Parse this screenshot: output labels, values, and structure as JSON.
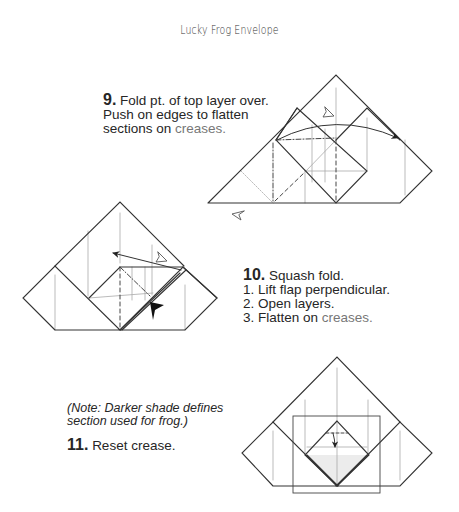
{
  "title": "Lucky Frog Envelope",
  "colors": {
    "text": "#262626",
    "crease_word": "#777777",
    "line": "#333333",
    "crease_line": "#aaaaaa",
    "shade": "#ededed"
  },
  "steps": [
    {
      "number": "9.",
      "lines": [
        "Fold pt. of top layer over.",
        "Push on edges to flatten",
        "sections on "
      ],
      "crease_word": "creases."
    },
    {
      "number": "10.",
      "title": "Squash fold.",
      "substeps": [
        "1. Lift flap perpendicular.",
        "2. Open layers.",
        "3. Flatten on "
      ],
      "crease_word": "creases."
    },
    {
      "note": [
        "(Note: Darker shade defines",
        "section used for frog.)"
      ],
      "number": "11.",
      "title": "Reset crease."
    }
  ],
  "icons": {
    "step9": [
      "valley-fold-arrow-icon",
      "turn-over-symbol-icon",
      "hollow-arrowhead-icon"
    ],
    "step10": [
      "fold-arrow-icon",
      "hollow-arrowhead-icon",
      "push-arrow-icon"
    ],
    "step11": [
      "reset-fold-arrow-icon"
    ]
  }
}
